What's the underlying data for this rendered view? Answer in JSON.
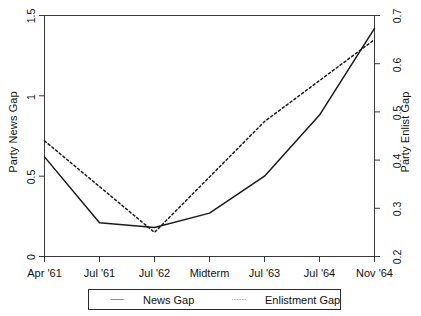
{
  "chart_data": {
    "type": "line",
    "title": "",
    "xlabel": "",
    "categories": [
      "Apr '61",
      "Jul '61",
      "Jul '62",
      "Midterm",
      "Jul '63",
      "Jul '64",
      "Nov '64"
    ],
    "grid": false,
    "legend_position": "bottom",
    "axes": {
      "left": {
        "label": "Party News Gap",
        "ticks": [
          "0",
          "0.5",
          "1",
          "1.5"
        ],
        "tick_values": [
          0,
          0.5,
          1,
          1.5
        ],
        "ylim": [
          0,
          1.5
        ]
      },
      "right": {
        "label": "Party Enlist Gap",
        "ticks": [
          "0.2",
          "0.3",
          "0.4",
          "0.5",
          "0.6",
          "0.7"
        ],
        "tick_values": [
          0.2,
          0.3,
          0.4,
          0.5,
          0.6,
          0.7
        ],
        "ylim": [
          0.2,
          0.7
        ]
      }
    },
    "series": [
      {
        "name": "News Gap",
        "axis": "left",
        "style": "solid",
        "color": "#1a1a1a",
        "values": [
          0.62,
          0.21,
          0.18,
          0.27,
          0.5,
          0.88,
          1.42
        ]
      },
      {
        "name": "Enlistment Gap",
        "axis": "right",
        "style": "dotted",
        "color": "#1a1a1a",
        "values": [
          0.44,
          0.345,
          0.25,
          0.365,
          0.48,
          0.565,
          0.65
        ]
      }
    ]
  },
  "legend": {
    "items": [
      {
        "label": "News Gap",
        "style": "solid"
      },
      {
        "label": "Enlistment Gap",
        "style": "dotted"
      }
    ]
  },
  "xticks": {
    "t0": "Apr '61",
    "t1": "Jul '61",
    "t2": "Jul '62",
    "t3": "Midterm",
    "t4": "Jul '63",
    "t5": "Jul '64",
    "t6": "Nov '64"
  },
  "yticks_left": {
    "v0": "0",
    "v1": "0.5",
    "v2": "1",
    "v3": "1.5"
  },
  "yticks_right": {
    "v0": "0.2",
    "v1": "0.3",
    "v2": "0.4",
    "v3": "0.5",
    "v4": "0.6",
    "v5": "0.7"
  },
  "labels": {
    "left_axis_title": "Party News Gap",
    "right_axis_title": "Party Enlist Gap"
  }
}
